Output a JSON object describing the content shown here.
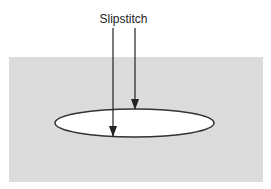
{
  "diagram": {
    "label": "Slipstitch",
    "colors": {
      "background": "#ffffff",
      "fabric": "#dcdcdc",
      "outline": "#333333",
      "opening_fill": "#ffffff"
    }
  }
}
